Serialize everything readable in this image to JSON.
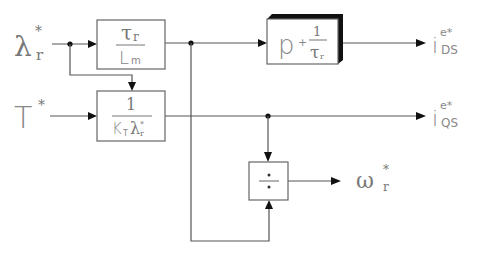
{
  "diagram": {
    "inputs": {
      "flux_ref": {
        "symbol": "λ",
        "sub": "r",
        "sup": "*"
      },
      "torque_ref": {
        "symbol": "T",
        "sup": "*"
      }
    },
    "blocks": {
      "flux_gain": {
        "num": "τ",
        "num_sub": "r",
        "den": "L",
        "den_sub": "m"
      },
      "torque_gain": {
        "num": "1",
        "den": "K",
        "den_sub": "T",
        "den2": "λ",
        "den2_sub": "r",
        "den2_sup": "*"
      },
      "flux_dynamics": {
        "p": "p",
        "plus": "+",
        "num": "1",
        "den": "τ",
        "den_sub": "r"
      },
      "divider": {
        "symbol": "÷"
      }
    },
    "outputs": {
      "ids": {
        "symbol": "i",
        "sup": "e*",
        "sub": "DS"
      },
      "iqs": {
        "symbol": "i",
        "sup": "e*",
        "sub": "QS"
      },
      "slip": {
        "symbol": "ω",
        "sup": "*",
        "sub": "r"
      }
    },
    "colors": {
      "wire": "#555555",
      "box_border": "#666666",
      "text": "#777777",
      "arrow": "#111111",
      "shadow": "#111111"
    }
  }
}
